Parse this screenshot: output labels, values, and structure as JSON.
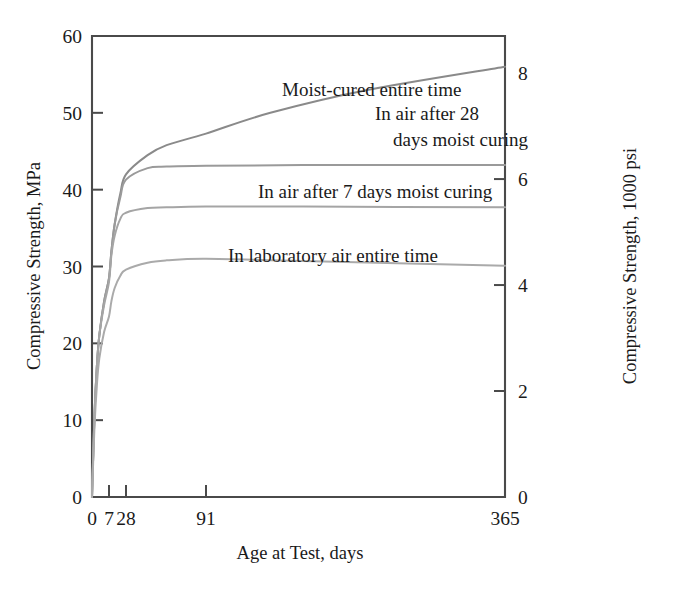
{
  "chart_data": {
    "type": "line",
    "title": "",
    "subtitle": "",
    "xlabel": "Age at Test, days",
    "ylabel": "Compressive Strength, MPa",
    "y2label": "Compressive Strength, 1000 psi",
    "grid": false,
    "legend_position": "inline-annotations",
    "x_scale": "nonlinear-age-axis",
    "x_ticks": [
      {
        "value": 0,
        "label": "0",
        "px": 92
      },
      {
        "value": 7,
        "label": "7",
        "px": 109
      },
      {
        "value": 28,
        "label": "28",
        "px": 126
      },
      {
        "value": 91,
        "label": "91",
        "px": 206
      },
      {
        "value": 365,
        "label": "365",
        "px": 505
      }
    ],
    "xlim": [
      0,
      365
    ],
    "y_ticks": [
      {
        "value": 0,
        "label": "0"
      },
      {
        "value": 10,
        "label": "10"
      },
      {
        "value": 20,
        "label": "20"
      },
      {
        "value": 30,
        "label": "30"
      },
      {
        "value": 40,
        "label": "40"
      },
      {
        "value": 50,
        "label": "50"
      },
      {
        "value": 60,
        "label": "60"
      }
    ],
    "ylim": [
      0,
      60
    ],
    "y2_ticks": [
      {
        "value": 0,
        "label": "0"
      },
      {
        "value": 2,
        "label": "2"
      },
      {
        "value": 4,
        "label": "4"
      },
      {
        "value": 6,
        "label": "6"
      },
      {
        "value": 8,
        "label": "8"
      }
    ],
    "y2lim": [
      0,
      8.7
    ],
    "y2_unit_conversion": "1000 psi = 6.895 MPa",
    "series": [
      {
        "name": "Moist-cured entire time",
        "color": "#8a8a8a",
        "label_text": "Moist-cured entire time",
        "label_lines": [
          "Moist-cured entire time"
        ],
        "label_x": 282,
        "label_y": 96,
        "points": [
          {
            "x": 0,
            "y": 0
          },
          {
            "x": 1,
            "y": 10.5
          },
          {
            "x": 2,
            "y": 17.0
          },
          {
            "x": 3,
            "y": 21.0
          },
          {
            "x": 5,
            "y": 25.5
          },
          {
            "x": 7,
            "y": 28.5
          },
          {
            "x": 10,
            "y": 32.0
          },
          {
            "x": 14,
            "y": 35.5
          },
          {
            "x": 21,
            "y": 39.5
          },
          {
            "x": 28,
            "y": 42.0
          },
          {
            "x": 45,
            "y": 44.5
          },
          {
            "x": 60,
            "y": 45.8
          },
          {
            "x": 91,
            "y": 47.3
          },
          {
            "x": 150,
            "y": 50.0
          },
          {
            "x": 240,
            "y": 53.0
          },
          {
            "x": 365,
            "y": 56.0
          }
        ]
      },
      {
        "name": "In air after 28 days moist curing",
        "color": "#9a9a9a",
        "label_text": "In air after 28 days moist curing",
        "label_lines": [
          "In air after 28",
          "days moist curing"
        ],
        "label_x": 375,
        "label_y": 120,
        "points": [
          {
            "x": 0,
            "y": 0
          },
          {
            "x": 1,
            "y": 10.5
          },
          {
            "x": 2,
            "y": 17.0
          },
          {
            "x": 3,
            "y": 21.0
          },
          {
            "x": 5,
            "y": 25.5
          },
          {
            "x": 7,
            "y": 28.5
          },
          {
            "x": 10,
            "y": 32.0
          },
          {
            "x": 14,
            "y": 35.5
          },
          {
            "x": 21,
            "y": 39.0
          },
          {
            "x": 28,
            "y": 41.3
          },
          {
            "x": 45,
            "y": 42.8
          },
          {
            "x": 60,
            "y": 43.0
          },
          {
            "x": 91,
            "y": 43.1
          },
          {
            "x": 180,
            "y": 43.2
          },
          {
            "x": 365,
            "y": 43.2
          }
        ]
      },
      {
        "name": "In air after 7 days moist curing",
        "color": "#a5a5a5",
        "label_text": "In air after 7 days moist curing",
        "label_lines": [
          "In air after 7 days moist curing"
        ],
        "label_x": 258,
        "label_y": 198,
        "points": [
          {
            "x": 0,
            "y": 0
          },
          {
            "x": 1,
            "y": 10.5
          },
          {
            "x": 2,
            "y": 17.0
          },
          {
            "x": 3,
            "y": 21.0
          },
          {
            "x": 5,
            "y": 25.0
          },
          {
            "x": 7,
            "y": 28.0
          },
          {
            "x": 10,
            "y": 31.5
          },
          {
            "x": 14,
            "y": 34.0
          },
          {
            "x": 21,
            "y": 36.2
          },
          {
            "x": 28,
            "y": 37.0
          },
          {
            "x": 45,
            "y": 37.6
          },
          {
            "x": 60,
            "y": 37.7
          },
          {
            "x": 91,
            "y": 37.8
          },
          {
            "x": 180,
            "y": 37.8
          },
          {
            "x": 365,
            "y": 37.7
          }
        ]
      },
      {
        "name": "In laboratory air entire time",
        "color": "#aaaaaa",
        "label_text": "In laboratory air entire time",
        "label_lines": [
          "In laboratory air entire time"
        ],
        "label_x": 228,
        "label_y": 262,
        "points": [
          {
            "x": 0,
            "y": 0
          },
          {
            "x": 1,
            "y": 9.0
          },
          {
            "x": 2,
            "y": 14.5
          },
          {
            "x": 3,
            "y": 18.0
          },
          {
            "x": 5,
            "y": 21.5
          },
          {
            "x": 7,
            "y": 23.5
          },
          {
            "x": 10,
            "y": 25.5
          },
          {
            "x": 14,
            "y": 27.2
          },
          {
            "x": 21,
            "y": 28.8
          },
          {
            "x": 28,
            "y": 29.6
          },
          {
            "x": 45,
            "y": 30.5
          },
          {
            "x": 60,
            "y": 30.8
          },
          {
            "x": 91,
            "y": 31.0
          },
          {
            "x": 180,
            "y": 30.7
          },
          {
            "x": 365,
            "y": 30.1
          }
        ]
      }
    ]
  },
  "axes": {
    "left_title": "Compressive Strength, MPa",
    "right_title": "Compressive Strength, 1000 psi",
    "bottom_title": "Age at Test, days",
    "left_ticks": [
      "60",
      "50",
      "40",
      "30",
      "20",
      "10",
      "0"
    ],
    "right_ticks": [
      "8",
      "6",
      "4",
      "2",
      "0"
    ],
    "bottom_ticks": [
      "0",
      "7",
      "28",
      "91",
      "365"
    ]
  },
  "annotations": {
    "moist_cured": "Moist-cured entire time",
    "air_28_line1": "In air after 28",
    "air_28_line2": "days moist curing",
    "air_7": "In air after 7 days moist curing",
    "lab_air": "In laboratory air entire time"
  },
  "colors": {
    "axis": "#4a4a4a",
    "text": "#1a1a1a",
    "curve_moist": "#8a8a8a",
    "curve_air28": "#9a9a9a",
    "curve_air7": "#a5a5a5",
    "curve_lab": "#aaaaaa",
    "background": "#ffffff"
  }
}
